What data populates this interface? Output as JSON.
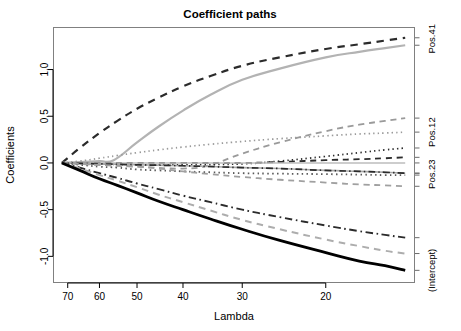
{
  "chart_data": {
    "type": "line",
    "title": "Coefficient paths",
    "xlabel": "Lambda",
    "ylabel": "Coefficients",
    "grid": false,
    "legend_position": "right-axis-labels",
    "x_axis": {
      "ticks": [
        70,
        60,
        50,
        40,
        30,
        20
      ],
      "tick_labels": [
        "70",
        "60",
        "50",
        "40",
        "30",
        "20"
      ],
      "direction": "decreasing",
      "scale": "log",
      "xlim": [
        75,
        13
      ]
    },
    "y_axis": {
      "ticks": [
        1.0,
        0.5,
        0.0,
        -0.5,
        -1.0
      ],
      "tick_labels": [
        "1.0",
        "0.5",
        "0.0",
        "-0.5",
        "-1.0"
      ],
      "ylim": [
        -1.28,
        1.45
      ]
    },
    "right_axis_labels": [
      {
        "label": "Pos.41",
        "value": 1.33
      },
      {
        "label": "Pos.12",
        "value": 0.33
      },
      {
        "label": "Pos.23",
        "value": -0.12
      },
      {
        "label": "(Intercept)",
        "value": -1.15
      }
    ],
    "series": [
      {
        "name": "Pos.41",
        "style": "dashed",
        "color": "#2b2b2b",
        "width": 2.2,
        "x": [
          72,
          66,
          60,
          55,
          50,
          45,
          40,
          35,
          30,
          25,
          20,
          17,
          15,
          13.6
        ],
        "values": [
          0.0,
          0.16,
          0.32,
          0.45,
          0.58,
          0.7,
          0.82,
          0.93,
          1.04,
          1.13,
          1.22,
          1.27,
          1.31,
          1.34
        ]
      },
      {
        "name": "Pos.41b",
        "style": "solid",
        "color": "#b3b3b3",
        "width": 2.2,
        "x": [
          72,
          66,
          60,
          56,
          50,
          45,
          40,
          35,
          30,
          25,
          20,
          17,
          15,
          13.6
        ],
        "values": [
          0.0,
          0.01,
          0.02,
          0.03,
          0.22,
          0.39,
          0.56,
          0.73,
          0.89,
          1.01,
          1.13,
          1.19,
          1.23,
          1.26
        ]
      },
      {
        "name": "grayDashUp",
        "style": "dashed",
        "color": "#9a9a9a",
        "width": 1.8,
        "x": [
          72,
          60,
          50,
          40,
          35,
          30,
          25,
          20,
          17,
          15,
          13.6
        ],
        "values": [
          0.0,
          -0.02,
          -0.04,
          -0.06,
          -0.02,
          0.1,
          0.22,
          0.34,
          0.41,
          0.45,
          0.48
        ]
      },
      {
        "name": "grayDotUp",
        "style": "dotted",
        "color": "#9a9a9a",
        "width": 1.7,
        "x": [
          72,
          66,
          60,
          55,
          50,
          45,
          40,
          35,
          30,
          25,
          20,
          17,
          15,
          13.6
        ],
        "values": [
          0.0,
          0.02,
          0.05,
          0.08,
          0.11,
          0.14,
          0.17,
          0.2,
          0.23,
          0.26,
          0.29,
          0.31,
          0.32,
          0.33
        ]
      },
      {
        "name": "darkDotUp",
        "style": "dotted",
        "color": "#2b2b2b",
        "width": 1.7,
        "x": [
          72,
          60,
          50,
          40,
          30,
          25,
          20,
          17,
          15,
          13.6
        ],
        "values": [
          0.0,
          -0.01,
          -0.02,
          -0.02,
          -0.01,
          0.02,
          0.07,
          0.11,
          0.14,
          0.16
        ]
      },
      {
        "name": "darkDashFlat",
        "style": "dashed",
        "color": "#2b2b2b",
        "width": 1.8,
        "x": [
          72,
          60,
          50,
          40,
          30,
          25,
          20,
          17,
          15,
          13.6
        ],
        "values": [
          0.0,
          0.0,
          0.0,
          0.0,
          0.0,
          0.01,
          0.03,
          0.04,
          0.05,
          0.06
        ]
      },
      {
        "name": "grayFlat",
        "style": "solid",
        "color": "#bdbdbd",
        "width": 1.6,
        "x": [
          72,
          60,
          50,
          40,
          30,
          20,
          13.6
        ],
        "values": [
          0.0,
          0.0,
          0.0,
          0.0,
          0.0,
          0.0,
          0.0
        ]
      },
      {
        "name": "grayDownSlight",
        "style": "solid",
        "color": "#a8a8a8",
        "width": 1.6,
        "x": [
          72,
          60,
          50,
          40,
          30,
          25,
          20,
          17,
          15,
          13.6
        ],
        "values": [
          0.0,
          -0.01,
          -0.02,
          -0.03,
          -0.05,
          -0.06,
          -0.08,
          -0.09,
          -0.1,
          -0.11
        ]
      },
      {
        "name": "darkDashDotFlat",
        "style": "dashdot",
        "color": "#2b2b2b",
        "width": 1.7,
        "x": [
          72,
          60,
          50,
          40,
          30,
          25,
          20,
          17,
          15,
          13.6
        ],
        "values": [
          0.0,
          -0.01,
          -0.02,
          -0.03,
          -0.05,
          -0.06,
          -0.08,
          -0.09,
          -0.1,
          -0.11
        ]
      },
      {
        "name": "Pos.23",
        "style": "dotted",
        "color": "#5a5a5a",
        "width": 1.8,
        "x": [
          72,
          66,
          60,
          55,
          50,
          45,
          40,
          35,
          30,
          25,
          20,
          17,
          15,
          13.6
        ],
        "values": [
          0.0,
          -0.02,
          -0.04,
          -0.05,
          -0.07,
          -0.08,
          -0.09,
          -0.1,
          -0.11,
          -0.115,
          -0.12,
          -0.125,
          -0.13,
          -0.13
        ]
      },
      {
        "name": "grayDashDown",
        "style": "dashed",
        "color": "#a0a0a0",
        "width": 1.8,
        "x": [
          72,
          60,
          50,
          45,
          40,
          35,
          30,
          25,
          20,
          17,
          15,
          13.6
        ],
        "values": [
          0.0,
          -0.02,
          -0.04,
          -0.06,
          -0.09,
          -0.12,
          -0.15,
          -0.18,
          -0.21,
          -0.23,
          -0.24,
          -0.25
        ]
      },
      {
        "name": "darkDashDotDown",
        "style": "dashdot",
        "color": "#2b2b2b",
        "width": 1.9,
        "x": [
          72,
          66,
          60,
          55,
          50,
          45,
          40,
          35,
          30,
          25,
          20,
          17,
          15,
          13.6
        ],
        "values": [
          0.0,
          -0.05,
          -0.11,
          -0.16,
          -0.22,
          -0.28,
          -0.35,
          -0.42,
          -0.5,
          -0.58,
          -0.67,
          -0.73,
          -0.77,
          -0.8
        ]
      },
      {
        "name": "grayDashSteep",
        "style": "dashed",
        "color": "#adadad",
        "width": 2.0,
        "x": [
          72,
          66,
          60,
          55,
          50,
          45,
          40,
          35,
          30,
          25,
          20,
          17,
          15,
          13.6
        ],
        "values": [
          0.0,
          -0.06,
          -0.13,
          -0.19,
          -0.26,
          -0.34,
          -0.42,
          -0.51,
          -0.61,
          -0.71,
          -0.82,
          -0.89,
          -0.94,
          -0.97
        ]
      },
      {
        "name": "(Intercept)",
        "style": "solid",
        "color": "#000000",
        "width": 2.8,
        "x": [
          72,
          66,
          60,
          55,
          50,
          45,
          40,
          35,
          30,
          25,
          20,
          17,
          15,
          13.6
        ],
        "values": [
          0.0,
          -0.08,
          -0.17,
          -0.24,
          -0.32,
          -0.41,
          -0.5,
          -0.6,
          -0.71,
          -0.83,
          -0.96,
          -1.05,
          -1.1,
          -1.15
        ]
      }
    ]
  }
}
